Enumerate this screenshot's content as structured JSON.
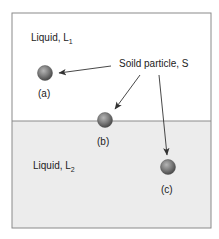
{
  "diagram": {
    "regions": {
      "upper": {
        "label": "Liquid, L",
        "subscript": "1",
        "fill": "#ffffff"
      },
      "lower": {
        "label": "Liquid, L",
        "subscript": "2",
        "fill": "#ececec"
      }
    },
    "callout": {
      "label": "Soild particle, S"
    },
    "particles": [
      {
        "id": "a",
        "caption": "(a)",
        "position": "in liquid L1"
      },
      {
        "id": "b",
        "caption": "(b)",
        "position": "at L1/L2 interface"
      },
      {
        "id": "c",
        "caption": "(c)",
        "position": "in liquid L2"
      }
    ],
    "colors": {
      "border": "#8a8a8a",
      "interface": "#8a8a8a",
      "particle": "#7a7a7a",
      "arrow": "#333333",
      "text": "#222222"
    }
  }
}
